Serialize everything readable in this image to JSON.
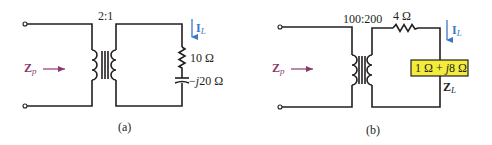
{
  "circuit_a": {
    "caption": "(a)",
    "turns_ratio": "2:1",
    "input_impedance_label": "Z",
    "input_impedance_sub": "p",
    "current_label": "I",
    "current_sub": "L",
    "resistor_label": "10 Ω",
    "capacitor_label_prefix": "−",
    "capacitor_label_j": "j",
    "capacitor_label_value": "20 Ω"
  },
  "circuit_b": {
    "caption": "(b)",
    "turns_ratio": "100:200",
    "series_resistor_label": "4 Ω",
    "input_impedance_label": "Z",
    "input_impedance_sub": "p",
    "current_label": "I",
    "current_sub": "L",
    "load_box_part1": "1 Ω + ",
    "load_box_j": "j",
    "load_box_part2": "8 Ω",
    "load_label": "Z",
    "load_sub": "L"
  },
  "colors": {
    "wire": "#231f20",
    "current_arrow": "#3b78c6",
    "impedance_arrow": "#8a3a6e",
    "load_box_fill": "#f3ec3a"
  }
}
